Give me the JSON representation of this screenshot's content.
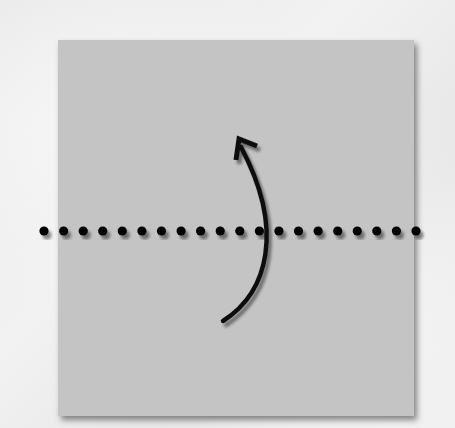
{
  "diagram": {
    "type": "origami-fold-step",
    "paper": {
      "color": "#c4c4c4",
      "x": 58,
      "y": 40,
      "width": 356,
      "height": 376
    },
    "fold_line": {
      "style": "mountain-dotted",
      "y": 231,
      "x_start": 44,
      "x_end": 416,
      "dot_count": 20,
      "color": "#000000"
    },
    "arrow": {
      "direction": "fold-bottom-up",
      "color": "#111111"
    },
    "background_color": "#ededed"
  }
}
